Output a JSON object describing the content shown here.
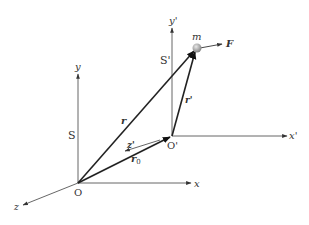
{
  "diagram": {
    "frame_S": {
      "label": "S",
      "origin_label": "O",
      "x_label": "x",
      "y_label": "y",
      "z_label": "z"
    },
    "frame_S_prime": {
      "label": "S'",
      "origin_label": "O'",
      "x_label": "x'",
      "y_label": "y'",
      "z_label": "z'"
    },
    "particle": {
      "label": "m"
    },
    "force": {
      "label": "F"
    },
    "vectors": {
      "r": "r",
      "r_prime": "r'",
      "r0": "r",
      "r0_sub": "0"
    },
    "colors": {
      "axis": "#555555",
      "vector": "#222222",
      "particle": "#9a9a9a",
      "background": "#ffffff"
    }
  }
}
